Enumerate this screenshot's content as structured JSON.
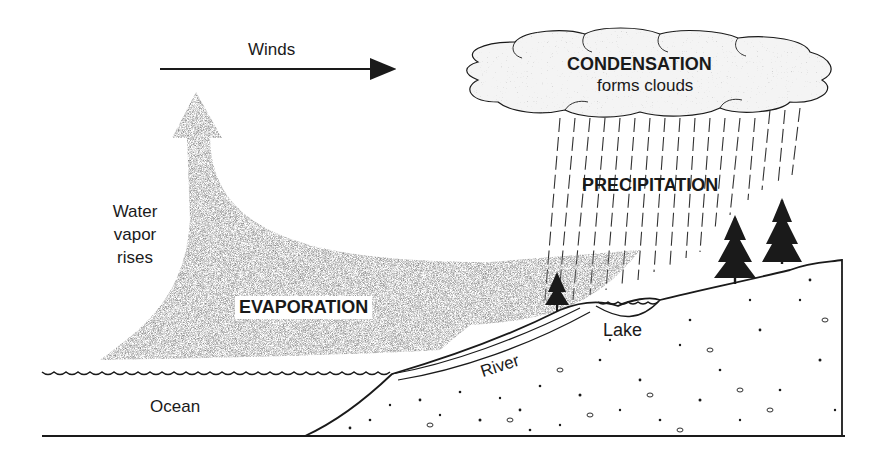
{
  "diagram": {
    "labels": {
      "winds": "Winds",
      "condensation": "CONDENSATION",
      "condensation_sub": "forms clouds",
      "precipitation": "PRECIPITATION",
      "water_vapor_line1": "Water",
      "water_vapor_line2": "vapor",
      "water_vapor_line3": "rises",
      "evaporation": "EVAPORATION",
      "lake": "Lake",
      "river": "River",
      "ocean": "Ocean"
    },
    "colors": {
      "ink": "#1a1a1a",
      "vapor": "#8a8a8a",
      "cloud_fill": "#f2f2f2",
      "background": "#ffffff"
    }
  }
}
